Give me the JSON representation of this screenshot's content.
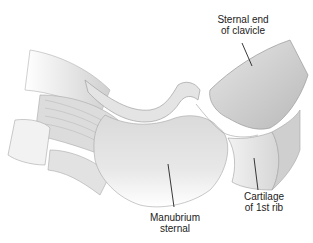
{
  "diagram": {
    "labels": [
      {
        "id": "clavicle",
        "line1": "Sternal end",
        "line2": "of clavicle"
      },
      {
        "id": "cartilage",
        "line1": "Cartilage",
        "line2": "of 1st rib"
      },
      {
        "id": "manubrium",
        "line1": "Manubrium",
        "line2": "sternal"
      }
    ],
    "colors": {
      "background": "#ffffff",
      "bone_light": "#ececec",
      "bone_mid": "#d4d4d4",
      "bone_dark": "#b8b8b8",
      "outline": "#9a9a9a",
      "leader": "#222222",
      "text": "#222222"
    }
  }
}
